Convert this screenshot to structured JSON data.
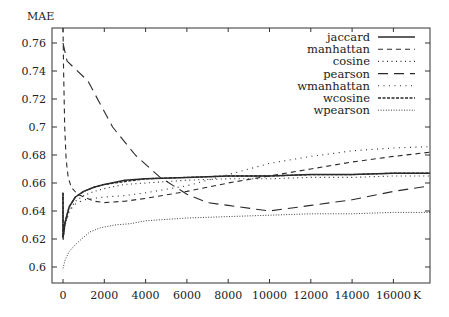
{
  "chart_data": {
    "type": "line",
    "title": "",
    "xlabel": "K",
    "ylabel": "MAE",
    "xlim": [
      -530,
      17770
    ],
    "ylim": [
      0.5886,
      0.771
    ],
    "x_ticks": [
      0,
      2000,
      4000,
      6000,
      8000,
      10000,
      12000,
      14000,
      16000
    ],
    "y_ticks": [
      0.6,
      0.62,
      0.64,
      0.66,
      0.68,
      0.7,
      0.72,
      0.74,
      0.76
    ],
    "y_tick_labels": [
      "0.6",
      "0.62",
      "0.64",
      "0.66",
      "0.68",
      "0.7",
      "0.72",
      "0.74",
      "0.76"
    ],
    "grid": false,
    "legend_position": "upper right",
    "series": [
      {
        "name": "jaccard",
        "style": "solid",
        "x": [
          0,
          0,
          100,
          300,
          600,
          1000,
          1500,
          2000,
          3000,
          4000,
          6000,
          8000,
          10000,
          12000,
          14000,
          16000,
          17770
        ],
        "y": [
          0.653,
          0.621,
          0.632,
          0.643,
          0.65,
          0.654,
          0.657,
          0.659,
          0.662,
          0.663,
          0.664,
          0.665,
          0.665,
          0.666,
          0.666,
          0.667,
          0.667
        ]
      },
      {
        "name": "manhattan",
        "style": "short-dash",
        "x": [
          0,
          30,
          80,
          150,
          250,
          400,
          700,
          1000,
          1500,
          2000,
          3000,
          4000,
          6000,
          8000,
          10000,
          12000,
          14000,
          16000,
          17770
        ],
        "y": [
          0.771,
          0.74,
          0.7,
          0.677,
          0.664,
          0.657,
          0.652,
          0.65,
          0.647,
          0.646,
          0.647,
          0.649,
          0.654,
          0.66,
          0.665,
          0.67,
          0.675,
          0.679,
          0.682
        ]
      },
      {
        "name": "cosine",
        "style": "dotted",
        "x": [
          0,
          0,
          100,
          300,
          600,
          1000,
          1500,
          2000,
          3000,
          4000,
          6000,
          8000,
          10000,
          12000,
          14000,
          16000,
          17770
        ],
        "y": [
          0.65,
          0.619,
          0.63,
          0.64,
          0.647,
          0.651,
          0.654,
          0.656,
          0.659,
          0.66,
          0.662,
          0.663,
          0.663,
          0.664,
          0.664,
          0.665,
          0.665
        ]
      },
      {
        "name": "pearson",
        "style": "long-dash",
        "x": [
          0,
          200,
          1200,
          2400,
          3500,
          4700,
          6000,
          7000,
          8000,
          10000,
          12000,
          14000,
          16000,
          17770
        ],
        "y": [
          0.76,
          0.747,
          0.733,
          0.7,
          0.68,
          0.664,
          0.652,
          0.646,
          0.644,
          0.64,
          0.644,
          0.648,
          0.654,
          0.658
        ]
      },
      {
        "name": "wmanhattan",
        "style": "sparse-dotted",
        "x": [
          0,
          0,
          100,
          300,
          600,
          1000,
          1500,
          2000,
          3000,
          4000,
          6000,
          8000,
          10000,
          12000,
          14000,
          16000,
          17770
        ],
        "y": [
          0.65,
          0.619,
          0.63,
          0.64,
          0.645,
          0.648,
          0.649,
          0.65,
          0.651,
          0.653,
          0.658,
          0.666,
          0.674,
          0.679,
          0.683,
          0.685,
          0.686
        ]
      },
      {
        "name": "wcosine",
        "style": "dense-dash",
        "x": [
          0,
          0,
          100,
          300,
          600,
          1000,
          1500,
          2000,
          3000,
          4000,
          6000,
          8000,
          10000,
          12000,
          14000,
          16000,
          17770
        ],
        "y": [
          0.653,
          0.621,
          0.632,
          0.643,
          0.65,
          0.654,
          0.657,
          0.659,
          0.661,
          0.663,
          0.664,
          0.665,
          0.665,
          0.666,
          0.666,
          0.667,
          0.667
        ]
      },
      {
        "name": "wpearson",
        "style": "fine-dotted",
        "x": [
          0,
          100,
          300,
          600,
          900,
          1300,
          1800,
          2500,
          3300,
          4000,
          6000,
          8000,
          10000,
          12000,
          14000,
          16000,
          17770
        ],
        "y": [
          0.599,
          0.605,
          0.611,
          0.616,
          0.62,
          0.625,
          0.628,
          0.63,
          0.631,
          0.633,
          0.635,
          0.636,
          0.637,
          0.638,
          0.638,
          0.639,
          0.639
        ]
      }
    ]
  },
  "legend": {
    "items": [
      {
        "label": "jaccard"
      },
      {
        "label": "manhattan"
      },
      {
        "label": "cosine"
      },
      {
        "label": "pearson"
      },
      {
        "label": "wmanhattan"
      },
      {
        "label": "wcosine"
      },
      {
        "label": "wpearson"
      }
    ]
  },
  "axes": {
    "ylabel": "MAE",
    "xlabel": "K",
    "x_tick_labels": [
      "0",
      "2000",
      "4000",
      "6000",
      "8000",
      "10000",
      "12000",
      "14000",
      "16000"
    ],
    "y_tick_labels": [
      "0.6",
      "0.62",
      "0.64",
      "0.66",
      "0.68",
      "0.7",
      "0.72",
      "0.74",
      "0.76"
    ]
  },
  "colors": {
    "line": "#2a2a2a",
    "frame": "#333333",
    "background": "#ffffff"
  }
}
